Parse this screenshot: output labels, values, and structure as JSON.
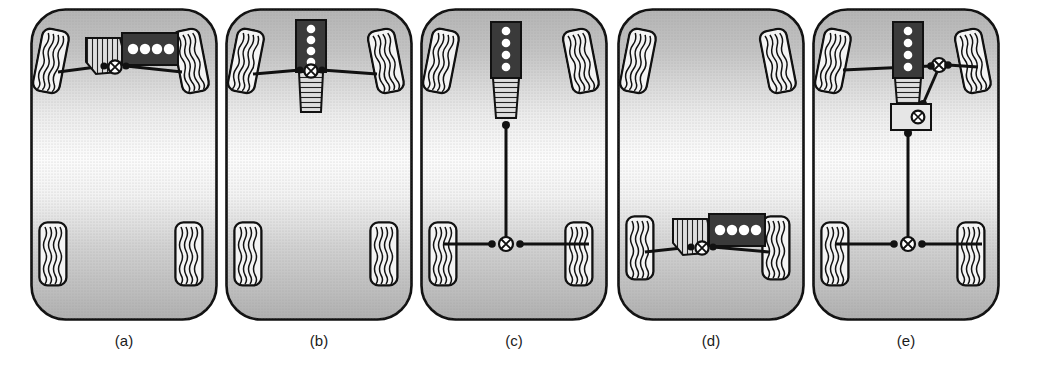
{
  "figure": {
    "panel_count": 5,
    "background_color": "#ffffff",
    "line_color": "#111111",
    "engine_block_color": "#3a3a3a",
    "cylinder_color": "#ffffff",
    "gearbox_color": "#d9d9d9",
    "body_fill_light": "#fbfbfb",
    "body_fill_dark": "#b9b9b9",
    "tire_fill": "#f2f2f2"
  },
  "panels": [
    {
      "caption": "(a)",
      "name": "front-transverse-engine-front-wheel-drive",
      "engine": {
        "position": "front",
        "orientation": "transverse",
        "cylinders": 4
      },
      "transmission": {
        "type": "transaxle",
        "position": "front-left-of-engine"
      },
      "driven_axle": "front",
      "differential": {
        "position": "front",
        "symbol": "circle-with-x"
      },
      "driveshaft": false,
      "front_wheels_steered": true
    },
    {
      "caption": "(b)",
      "name": "front-longitudinal-engine-front-wheel-drive",
      "engine": {
        "position": "front",
        "orientation": "longitudinal",
        "cylinders": 4
      },
      "transmission": {
        "type": "gearbox",
        "position": "behind-engine"
      },
      "driven_axle": "front",
      "differential": {
        "position": "front",
        "symbol": "circle-with-x"
      },
      "driveshaft": false,
      "front_wheels_steered": true
    },
    {
      "caption": "(c)",
      "name": "front-longitudinal-engine-rear-wheel-drive",
      "engine": {
        "position": "front",
        "orientation": "longitudinal",
        "cylinders": 4
      },
      "transmission": {
        "type": "gearbox",
        "position": "behind-engine"
      },
      "driven_axle": "rear",
      "differential": {
        "position": "rear",
        "symbol": "circle-with-x"
      },
      "driveshaft": true,
      "front_wheels_steered": true
    },
    {
      "caption": "(d)",
      "name": "rear-transverse-engine-rear-wheel-drive",
      "engine": {
        "position": "rear",
        "orientation": "transverse",
        "cylinders": 4
      },
      "transmission": {
        "type": "transaxle",
        "position": "front-left-of-engine"
      },
      "driven_axle": "rear",
      "differential": {
        "position": "rear",
        "symbol": "circle-with-x"
      },
      "driveshaft": false,
      "front_wheels_steered": true
    },
    {
      "caption": "(e)",
      "name": "front-longitudinal-engine-all-wheel-drive",
      "engine": {
        "position": "front",
        "orientation": "longitudinal",
        "cylinders": 4
      },
      "transmission": {
        "type": "gearbox-with-transfer-case",
        "position": "behind-engine"
      },
      "driven_axle": "all",
      "differential": {
        "position": "front-and-rear",
        "symbol": "circle-with-x"
      },
      "transfer_case": true,
      "driveshaft": true,
      "front_wheels_steered": true
    }
  ]
}
